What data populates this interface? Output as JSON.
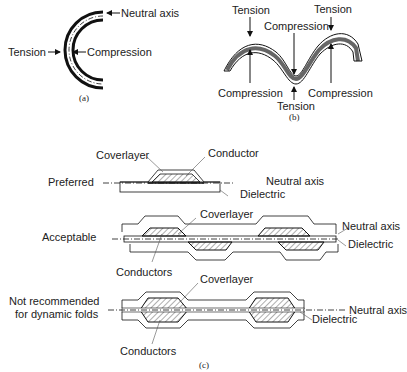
{
  "panel_a": {
    "labels": {
      "neutral_axis": "Neutral axis",
      "tension": "Tension",
      "compression": "Compression"
    },
    "caption": "(a)"
  },
  "panel_b": {
    "labels": {
      "tension_left": "Tension",
      "tension_right": "Tension",
      "tension_bottom": "Tension",
      "compression_top": "Compression",
      "compression_left": "Compression",
      "compression_right": "Compression"
    },
    "caption": "(b)"
  },
  "panel_c": {
    "preferred": {
      "row_label": "Preferred",
      "coverlayer": "Coverlayer",
      "conductor": "Conductor",
      "neutral_axis": "Neutral axis",
      "dielectric": "Dielectric"
    },
    "acceptable": {
      "row_label": "Acceptable",
      "coverlayer": "Coverlayer",
      "conductors": "Conductors",
      "neutral_axis": "Neutral axis",
      "dielectric": "Dielectric"
    },
    "not_recommended": {
      "row_label_line1": "Not recommended",
      "row_label_line2": "for dynamic folds",
      "coverlayer": "Coverlayer",
      "conductors": "Conductors",
      "neutral_axis": "Neutral axis",
      "dielectric": "Dielectric"
    },
    "caption": "(c)"
  }
}
